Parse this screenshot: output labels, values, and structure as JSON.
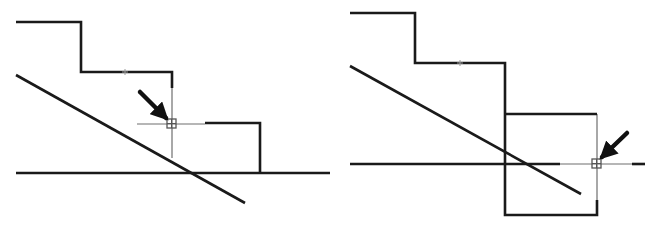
{
  "diagram": {
    "colors": {
      "line": "#1a1a1a",
      "thin": "#6e6e6e",
      "snap": "#555555",
      "background": "#ffffff"
    },
    "panels": [
      {
        "id": "left",
        "thick_paths": [
          "M16,22 L81,22 L81,72 L172,72 L172,88",
          "M205,123 L260,123 L260,173",
          "M16,173 L330,173",
          "M16,75 L245,203"
        ],
        "thin_paths": [
          "M172,88 L172,158",
          "M137,124 L205,124"
        ],
        "snap_box": {
          "x": 167,
          "y": 119,
          "size": 9
        },
        "arrow": {
          "x1": 140,
          "y1": 92,
          "x2": 166,
          "y2": 118
        },
        "tick": {
          "x": 125,
          "y": 72
        }
      },
      {
        "id": "right",
        "thick_paths": [
          "M350,13 L415,13 L415,63 L505,63 L505,215 L597,215 L597,200",
          "M505,114 L597,114",
          "M350,164 L560,164",
          "M632,164 L645,164",
          "M350,66 L581,194"
        ],
        "thin_paths": [
          "M597,114 L597,200",
          "M560,164 L632,164"
        ],
        "snap_box": {
          "x": 592,
          "y": 159,
          "size": 9
        },
        "arrow": {
          "x1": 627,
          "y1": 133,
          "x2": 602,
          "y2": 157
        },
        "tick": {
          "x": 460,
          "y": 63
        }
      }
    ]
  }
}
